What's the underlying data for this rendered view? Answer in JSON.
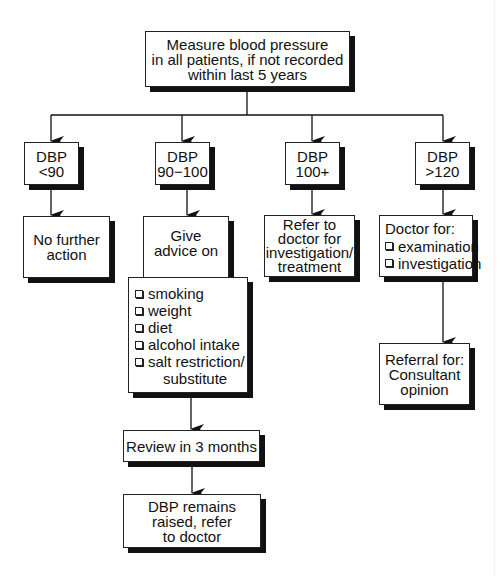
{
  "diagram": {
    "type": "flowchart",
    "start": {
      "lines": [
        "Measure blood pressure",
        "in all patients, if not recorded",
        "within last 5 years"
      ]
    },
    "branches": [
      {
        "condition": {
          "lines": [
            "DBP",
            "<90"
          ]
        },
        "actions": [
          {
            "lines": [
              "No further",
              "action"
            ]
          }
        ]
      },
      {
        "condition": {
          "lines": [
            "DBP",
            "90−100"
          ]
        },
        "actions": [
          {
            "lines": [
              "Give",
              "advice on"
            ]
          },
          {
            "items": [
              "smoking",
              "weight",
              "diet",
              "alcohol intake",
              "salt restriction/"
            ],
            "continuation": "substitute"
          },
          {
            "lines": [
              "Review in 3 months"
            ]
          },
          {
            "lines": [
              "DBP remains",
              "raised, refer",
              "to doctor"
            ]
          }
        ]
      },
      {
        "condition": {
          "lines": [
            "DBP",
            "100+"
          ]
        },
        "actions": [
          {
            "lines": [
              "Refer to",
              "doctor for",
              "investigation/",
              "treatment"
            ]
          }
        ]
      },
      {
        "condition": {
          "lines": [
            "DBP",
            ">120"
          ]
        },
        "actions": [
          {
            "heading": "Doctor for:",
            "items": [
              "examination",
              "investigation"
            ]
          },
          {
            "lines": [
              "Referral for:",
              "Consultant",
              "opinion"
            ]
          }
        ]
      }
    ],
    "colors": {
      "line": "#111111",
      "box_fill": "#ffffff",
      "shadow": "#111111",
      "background": "#ffffff"
    }
  }
}
